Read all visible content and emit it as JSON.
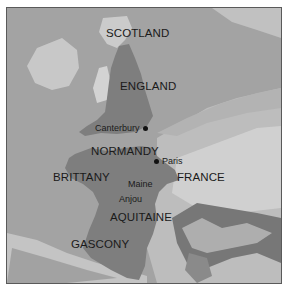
{
  "map": {
    "title": "",
    "colors": {
      "sea": "#a3a3a3",
      "land_light": "#c9c9c9",
      "land_relief": "#dcdcdc",
      "angevin_territory": "#7e7e7e",
      "mountains_dark": "#6a6a6a",
      "border": "#5a5a5a",
      "text": "#1a1a1a"
    },
    "regions": [
      {
        "name": "SCOTLAND"
      },
      {
        "name": "ENGLAND"
      },
      {
        "name": "NORMANDY"
      },
      {
        "name": "BRITTANY"
      },
      {
        "name": "FRANCE"
      },
      {
        "name": "AQUITAINE"
      },
      {
        "name": "GASCONY"
      }
    ],
    "subregions": [
      {
        "name": "Maine"
      },
      {
        "name": "Anjou"
      }
    ],
    "cities": [
      {
        "name": "Canterbury"
      },
      {
        "name": "Paris"
      }
    ]
  }
}
